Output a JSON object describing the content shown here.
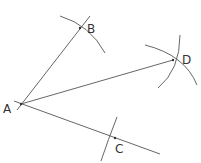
{
  "diagram": {
    "points": [
      {
        "id": "A",
        "label": "A",
        "x": 21,
        "y": 104
      },
      {
        "id": "B",
        "label": "B",
        "x": 80,
        "y": 28
      },
      {
        "id": "C",
        "label": "C",
        "x": 115,
        "y": 138
      },
      {
        "id": "D",
        "label": "D",
        "x": 173,
        "y": 60
      }
    ],
    "segments": [
      {
        "from": "A",
        "to": "B",
        "extended": true
      },
      {
        "from": "A",
        "to": "C",
        "extended": true
      },
      {
        "from": "A",
        "to": "D",
        "extended": false
      }
    ],
    "arcs": [
      "arc through B",
      "arc through C",
      "two arcs intersecting at D"
    ],
    "stroke_color": "#555555"
  }
}
